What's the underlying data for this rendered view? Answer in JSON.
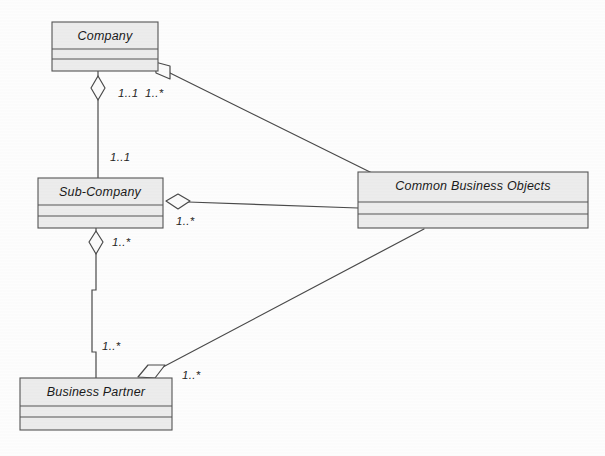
{
  "diagram": {
    "kind": "uml-class-diagram",
    "title_visible": "",
    "background_color": "#fdfdfd",
    "box_fill_color": "#ececec",
    "box_border_color": "#555555",
    "line_color": "#4a4a4a",
    "classes": [
      {
        "id": "company",
        "name": "Company",
        "x": 52,
        "y": 22,
        "w": 106,
        "h": 49,
        "title_h": 27,
        "mid_h": 10
      },
      {
        "id": "sub-company",
        "name": "Sub-Company",
        "x": 38,
        "y": 178,
        "w": 125,
        "h": 50,
        "title_h": 27,
        "mid_h": 11
      },
      {
        "id": "common-business-objects",
        "name": "Common Business Objects",
        "x": 358,
        "y": 172,
        "w": 230,
        "h": 56,
        "title_h": 30,
        "mid_h": 12
      },
      {
        "id": "business-partner",
        "name": "Business Partner",
        "x": 20,
        "y": 378,
        "w": 152,
        "h": 52,
        "title_h": 28,
        "mid_h": 11
      }
    ],
    "associations": [
      {
        "id": "company-subcompany",
        "from": "company",
        "to": "sub-company",
        "type": "aggregation",
        "source_multiplicity": "1..1",
        "target_multiplicity": "1..1"
      },
      {
        "id": "company-cbo",
        "from": "company",
        "to": "common-business-objects",
        "type": "aggregation",
        "source_multiplicity": "1..*"
      },
      {
        "id": "subcompany-cbo",
        "from": "sub-company",
        "to": "common-business-objects",
        "type": "aggregation",
        "source_multiplicity": "1..*"
      },
      {
        "id": "subcompany-businesspartner",
        "from": "sub-company",
        "to": "business-partner",
        "type": "aggregation",
        "source_multiplicity": "1..*",
        "target_multiplicity": "1..*"
      },
      {
        "id": "businesspartner-cbo",
        "from": "business-partner",
        "to": "common-business-objects",
        "type": "aggregation",
        "source_multiplicity": "1..*"
      }
    ],
    "multiplicity_labels": [
      {
        "id": "m-company-down",
        "text": "1..1",
        "x": 118,
        "y": 97
      },
      {
        "id": "m-company-right",
        "text": "1..*",
        "x": 145,
        "y": 97
      },
      {
        "id": "m-subcompany-top",
        "text": "1..1",
        "x": 110,
        "y": 161
      },
      {
        "id": "m-subcompany-right",
        "text": "1..*",
        "x": 176,
        "y": 225
      },
      {
        "id": "m-subcompany-down",
        "text": "1..*",
        "x": 112,
        "y": 246
      },
      {
        "id": "m-bp-up",
        "text": "1..*",
        "x": 102,
        "y": 350
      },
      {
        "id": "m-bp-right",
        "text": "1..*",
        "x": 182,
        "y": 379
      }
    ],
    "caption": ""
  }
}
